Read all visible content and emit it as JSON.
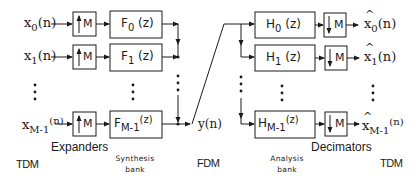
{
  "inputs": [
    {
      "base": "x",
      "sub": "0",
      "arg": "(n)"
    },
    {
      "base": "x",
      "sub": "1",
      "arg": "(n)"
    },
    {
      "base": "x",
      "sub": "M-1",
      "arg": "(n)"
    }
  ],
  "expanders": {
    "label": "M",
    "arrow": "up",
    "caption": "Expanders"
  },
  "synthesis_filters": [
    {
      "base": "F",
      "sub": "0",
      "arg": "(z)"
    },
    {
      "base": "F",
      "sub": "1",
      "arg": "(z)"
    },
    {
      "base": "F",
      "sub": "M-1",
      "arg": "(z)"
    }
  ],
  "synthesis_caption": {
    "line1": "Synthesis",
    "line2": "bank"
  },
  "channel": {
    "label": "y(n)"
  },
  "analysis_filters": [
    {
      "base": "H",
      "sub": "0",
      "arg": "(z)"
    },
    {
      "base": "H",
      "sub": "1",
      "arg": "(z)"
    },
    {
      "base": "H",
      "sub": "M-1",
      "arg": "(z)"
    }
  ],
  "analysis_caption": {
    "line1": "Analysis",
    "line2": "bank"
  },
  "decimators": {
    "label": "M",
    "arrow": "down",
    "caption": "Decimators"
  },
  "outputs": [
    {
      "base": "x",
      "sub": "0",
      "arg": "(n)"
    },
    {
      "base": "x",
      "sub": "1",
      "arg": "(n)"
    },
    {
      "base": "x",
      "sub": "M-1",
      "arg": "(n)"
    }
  ],
  "bottom_labels": {
    "left": "TDM",
    "middle": "FDM",
    "right": "TDM"
  }
}
